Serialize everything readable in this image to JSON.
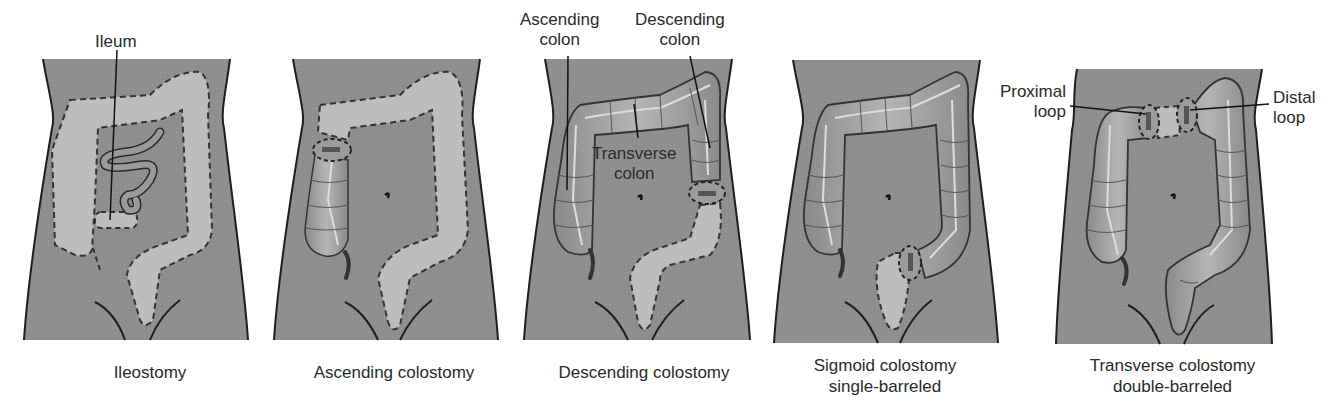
{
  "figure": {
    "colors": {
      "body": "#8f8f8f",
      "outline": "#1e1e1e",
      "removed_colon": "#bdbdbd",
      "colon": "#a9a9a9",
      "colon_highlight": "#d6d6d6"
    },
    "panels": [
      {
        "id": "ileostomy",
        "caption_lines": [
          "Ileostomy"
        ],
        "labels": [
          {
            "text": "Ileum"
          }
        ]
      },
      {
        "id": "ascending-colostomy",
        "caption_lines": [
          "Ascending colostomy"
        ],
        "labels": []
      },
      {
        "id": "descending-colostomy",
        "caption_lines": [
          "Descending colostomy"
        ],
        "labels": [
          {
            "text_lines": [
              "Ascending",
              "colon"
            ]
          },
          {
            "text_lines": [
              "Descending",
              "colon"
            ]
          },
          {
            "text_lines": [
              "Transverse",
              "colon"
            ]
          }
        ]
      },
      {
        "id": "sigmoid-colostomy",
        "caption_lines": [
          "Sigmoid colostomy",
          "single-barreled"
        ],
        "labels": []
      },
      {
        "id": "transverse-colostomy",
        "caption_lines": [
          "Transverse colostomy",
          "double-barreled"
        ],
        "labels": [
          {
            "text_lines": [
              "Proximal",
              "loop"
            ]
          },
          {
            "text_lines": [
              "Distal",
              "loop"
            ]
          }
        ]
      }
    ]
  }
}
